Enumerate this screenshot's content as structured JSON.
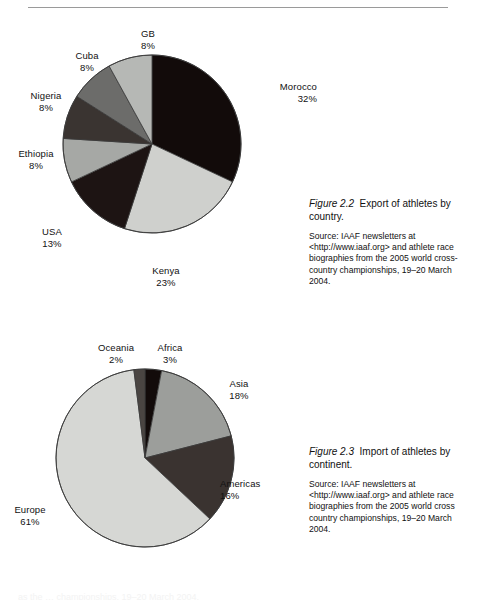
{
  "page": {
    "bottom_partial_text": "as the          …  championships, 19–20 March 2004."
  },
  "chart_data": [
    {
      "id": "figure-2-2",
      "type": "pie",
      "title": "Export of athletes by country",
      "categories": [
        "Morocco",
        "Kenya",
        "USA",
        "Ethiopia",
        "Nigeria",
        "Cuba",
        "GB"
      ],
      "values": [
        32,
        23,
        13,
        8,
        8,
        8,
        8
      ],
      "value_labels": [
        "32%",
        "23%",
        "13%",
        "8%",
        "8%",
        "8%",
        "8%"
      ],
      "colors": [
        "#120b0a",
        "#cfd0cd",
        "#1d1413",
        "#a6a8a5",
        "#3a3431",
        "#6c6c6a",
        "#b6b8b5"
      ],
      "stroke": "#3a3a3a",
      "start_angle_deg": 0,
      "legend": "none",
      "labels_position": "outside-callout"
    },
    {
      "id": "figure-2-3",
      "type": "pie",
      "title": "Import of athletes by continent",
      "categories": [
        "Africa",
        "Asia",
        "Americas",
        "Europe",
        "Oceania"
      ],
      "values": [
        3,
        18,
        16,
        61,
        2
      ],
      "value_labels": [
        "3%",
        "18%",
        "16%",
        "61%",
        "2%"
      ],
      "colors": [
        "#120b0a",
        "#9c9e9b",
        "#3a3330",
        "#d6d7d4",
        "#4a4542"
      ],
      "stroke": "#3a3a3a",
      "start_angle_deg": 0,
      "legend": "none",
      "labels_position": "outside-callout"
    }
  ],
  "figures": [
    {
      "number": "Figure 2.2",
      "title": "Export of athletes by country.",
      "source": "Source: IAAF newsletters at <http://www.iaaf.org> and athlete race biographies from the 2005 world cross-country championships, 19–20 March 2004.",
      "labels": [
        {
          "name": "Morocco",
          "pct": "32%"
        },
        {
          "name": "Kenya",
          "pct": "23%"
        },
        {
          "name": "USA",
          "pct": "13%"
        },
        {
          "name": "Ethiopia",
          "pct": "8%"
        },
        {
          "name": "Nigeria",
          "pct": "8%"
        },
        {
          "name": "Cuba",
          "pct": "8%"
        },
        {
          "name": "GB",
          "pct": "8%"
        }
      ]
    },
    {
      "number": "Figure 2.3",
      "title": "Import of athletes by continent.",
      "source": "Source: IAAF newsletters at <http://www.iaaf.org> and athlete race biographies from the 2005 world cross country championships, 19–20 March 2004.",
      "labels": [
        {
          "name": "Oceania",
          "pct": "2%"
        },
        {
          "name": "Africa",
          "pct": "3%"
        },
        {
          "name": "Asia",
          "pct": "18%"
        },
        {
          "name": "Americas",
          "pct": "16%"
        },
        {
          "name": "Europe",
          "pct": "61%"
        }
      ]
    }
  ]
}
